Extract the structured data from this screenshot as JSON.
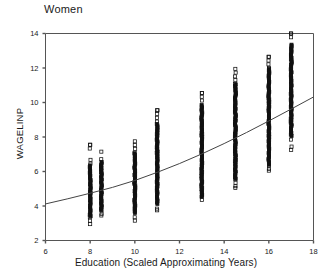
{
  "chart_data": {
    "type": "scatter",
    "title": "Women",
    "xlabel": "Education (Scaled Approximating Years)",
    "ylabel": "WAGELINP",
    "xlim": [
      6,
      18
    ],
    "ylim": [
      2,
      14
    ],
    "xticks": [
      6,
      8,
      10,
      12,
      14,
      16,
      18
    ],
    "yticks": [
      2,
      4,
      6,
      8,
      10,
      12,
      14
    ],
    "grid": false,
    "legend": null,
    "marker": "open-square",
    "note": "Dense vertical strips of open-square markers at discrete education values, plus a monotonically increasing convex fitted curve.",
    "series": [
      {
        "name": "WAGELINP observations",
        "type": "scatter",
        "marker": "open-square",
        "columns": [
          {
            "x": 8.0,
            "y_min": 2.95,
            "y_max": 7.55,
            "y_dense_min": 3.35,
            "y_dense_max": 6.35,
            "n": 230
          },
          {
            "x": 8.5,
            "y_min": 3.45,
            "y_max": 7.15,
            "y_dense_min": 3.75,
            "y_dense_max": 6.55,
            "n": 150
          },
          {
            "x": 10.0,
            "y_min": 3.15,
            "y_max": 7.75,
            "y_dense_min": 3.55,
            "y_dense_max": 7.05,
            "n": 300
          },
          {
            "x": 11.0,
            "y_min": 3.75,
            "y_max": 9.55,
            "y_dense_min": 4.05,
            "y_dense_max": 8.75,
            "n": 290
          },
          {
            "x": 13.0,
            "y_min": 4.35,
            "y_max": 10.55,
            "y_dense_min": 4.55,
            "y_dense_max": 9.85,
            "n": 330
          },
          {
            "x": 14.5,
            "y_min": 5.05,
            "y_max": 11.95,
            "y_dense_min": 5.55,
            "y_dense_max": 11.05,
            "n": 350
          },
          {
            "x": 16.0,
            "y_min": 6.05,
            "y_max": 12.65,
            "y_dense_min": 6.35,
            "y_dense_max": 11.95,
            "n": 320
          },
          {
            "x": 17.0,
            "y_min": 7.25,
            "y_max": 14.0,
            "y_dense_min": 8.05,
            "y_dense_max": 13.35,
            "n": 180
          }
        ]
      },
      {
        "name": "Fitted curve",
        "type": "line",
        "points": [
          {
            "x": 6.0,
            "y": 4.12
          },
          {
            "x": 7.0,
            "y": 4.42
          },
          {
            "x": 8.0,
            "y": 4.74
          },
          {
            "x": 9.0,
            "y": 5.08
          },
          {
            "x": 10.0,
            "y": 5.48
          },
          {
            "x": 11.0,
            "y": 5.95
          },
          {
            "x": 12.0,
            "y": 6.46
          },
          {
            "x": 13.0,
            "y": 7.02
          },
          {
            "x": 14.0,
            "y": 7.62
          },
          {
            "x": 15.0,
            "y": 8.26
          },
          {
            "x": 16.0,
            "y": 8.93
          },
          {
            "x": 17.0,
            "y": 9.62
          },
          {
            "x": 18.0,
            "y": 10.32
          }
        ]
      }
    ]
  },
  "colors": {
    "axis": "#555555",
    "marker": "#111111",
    "curve": "#444444",
    "text": "#1a1a1a",
    "background": "#ffffff"
  }
}
